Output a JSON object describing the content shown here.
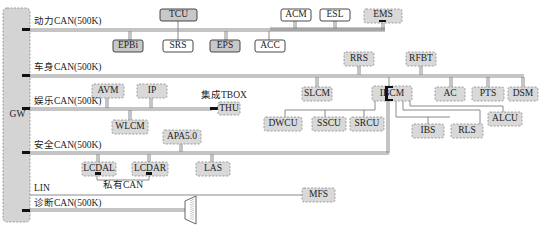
{
  "gateway": {
    "label": "GW"
  },
  "buses": [
    {
      "id": "powertrain",
      "label": "动力CAN(500K)"
    },
    {
      "id": "body",
      "label": "车身CAN(500K)"
    },
    {
      "id": "infotainment",
      "label": "娱乐CAN(500K)"
    },
    {
      "id": "safety",
      "label": "安全CAN(500K)"
    },
    {
      "id": "lin",
      "label": "LIN"
    },
    {
      "id": "diagnostic",
      "label": "诊断CAN(500K)"
    }
  ],
  "annotations": {
    "tbox": "集成TBOX",
    "private_can": "私有CAN"
  },
  "nodes": {
    "powertrain": [
      "TCU",
      "EPBi",
      "SRS",
      "EPS",
      "ACC",
      "ACM",
      "ESL",
      "EMS"
    ],
    "body": [
      "RRS",
      "RFBT",
      "SLCM",
      "IBCM",
      "AC",
      "PTS",
      "DSM"
    ],
    "ibcm_sub": [
      "DWCU",
      "SSCU",
      "SRCU",
      "IBS",
      "RLS",
      "ALCU"
    ],
    "infotainment": [
      "AVM",
      "IP",
      "WLCM",
      "THU"
    ],
    "safety": [
      "APA5.0",
      "LCDAL",
      "LCDAR",
      "LAS"
    ],
    "lin": [
      "MFS"
    ]
  },
  "connector": {
    "label": "OBD"
  }
}
